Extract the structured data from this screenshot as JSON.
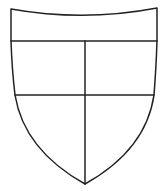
{
  "diagram": {
    "type": "heraldic-shield",
    "colors": {
      "stroke": "#222222",
      "field": "#ffffff",
      "background": "#ffffff"
    },
    "divisions": {
      "chief_line": "horizontal",
      "fess_line": "horizontal",
      "pale_line": "vertical"
    },
    "regions": [
      {
        "id": "chief",
        "label": ""
      },
      {
        "id": "dexter-upper",
        "label": ""
      },
      {
        "id": "sinister-upper",
        "label": ""
      },
      {
        "id": "dexter-lower",
        "label": ""
      },
      {
        "id": "sinister-lower",
        "label": ""
      }
    ]
  }
}
